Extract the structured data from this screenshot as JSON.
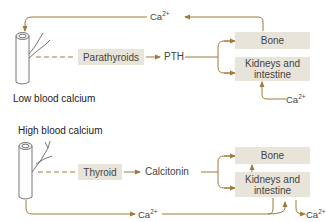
{
  "colors": {
    "arrow": "#a07a3c",
    "box_fill": "#e8e4da",
    "text": "#444444"
  },
  "panels": [
    {
      "title": "Low blood calcium",
      "gland": "Parathyroids",
      "hormone": "PTH",
      "targets": [
        "Bone",
        "Kidneys and intestine"
      ],
      "ion_top": {
        "base": "Ca",
        "charge": "2+"
      },
      "ion_in": {
        "base": "Ca",
        "charge": "2+"
      }
    },
    {
      "title": "High blood calcium",
      "gland": "Thyroid",
      "hormone": "Calcitonin",
      "targets": [
        "Bone",
        "Kidneys and intestine"
      ],
      "ion_bottom": {
        "base": "Ca",
        "charge": "2+"
      },
      "ion_out": {
        "base": "Ca",
        "charge": "2+"
      }
    }
  ],
  "icons": {
    "blood_vessel": "blood-vessel-icon"
  }
}
